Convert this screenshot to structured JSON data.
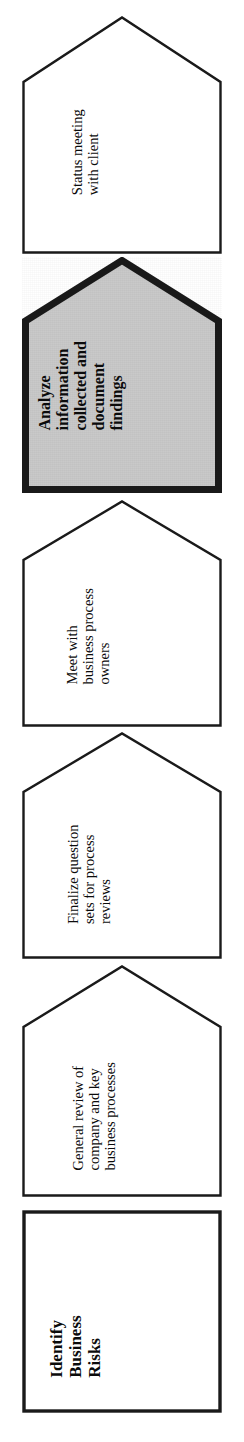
{
  "diagram": {
    "orientation": "vertical-stack-rotated",
    "colors": {
      "outline": "#1a1a1a",
      "fill_default": "#ffffff",
      "fill_highlight": "#c9c9c9",
      "text": "#0b0b0b"
    },
    "steps": [
      {
        "id": "status-meeting",
        "shape": "pentagon-arrow",
        "emphasis": false,
        "fill": "#ffffff",
        "border_width": 2,
        "lines": [
          "Status meeting",
          "with client"
        ],
        "text": "Status meeting with client"
      },
      {
        "id": "analyze-information",
        "shape": "pentagon-arrow",
        "emphasis": true,
        "fill": "#c9c9c9",
        "border_width": 6,
        "lines": [
          "Analyze",
          "information",
          "collected and",
          "document",
          "findings"
        ],
        "text": "Analyze information collected and document findings"
      },
      {
        "id": "meet-business-process-owners",
        "shape": "pentagon-arrow",
        "emphasis": false,
        "fill": "#ffffff",
        "border_width": 2,
        "lines": [
          "Meet with",
          "business process",
          "owners"
        ],
        "text": "Meet with business process owners"
      },
      {
        "id": "finalize-question-sets",
        "shape": "pentagon-arrow",
        "emphasis": false,
        "fill": "#ffffff",
        "border_width": 2,
        "lines": [
          "Finalize question",
          "sets for process",
          "reviews"
        ],
        "text": "Finalize question sets for process reviews"
      },
      {
        "id": "general-review",
        "shape": "pentagon-arrow",
        "emphasis": false,
        "fill": "#ffffff",
        "border_width": 2,
        "lines": [
          "General review of",
          "company and key",
          "business processes"
        ],
        "text": "General review of company and key business processes"
      },
      {
        "id": "identify-business-risks",
        "shape": "rectangle",
        "emphasis": true,
        "fill": "#ffffff",
        "border_width": 3,
        "lines": [
          "Identify",
          "Business",
          "Risks"
        ],
        "text": "Identify Business Risks"
      }
    ]
  }
}
